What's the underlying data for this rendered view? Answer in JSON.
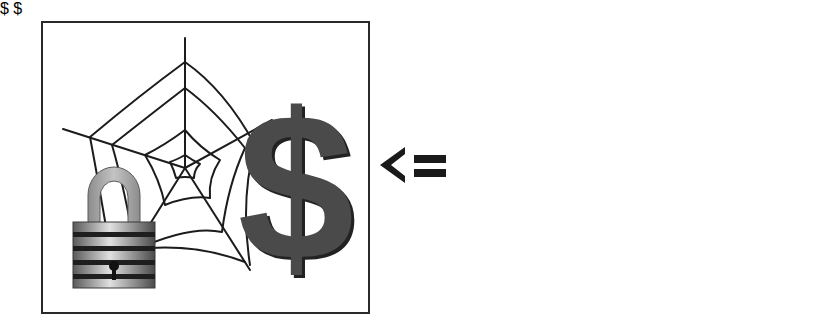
{
  "diagram": {
    "operator_symbol": "<=",
    "left_panel": {
      "description": "Secured web with payment",
      "elements": [
        "spider-web",
        "padlock",
        "dollar-sign"
      ],
      "dollar_glyph": "$"
    },
    "right_panel": {
      "description": "User at computer thinking about web payment",
      "elements": [
        "computer",
        "person",
        "speech-bubble",
        "spider-web",
        "dollar-sign"
      ],
      "dollar_glyph": "$"
    },
    "colors": {
      "stroke": "#1c1c1c",
      "dollar_fill": "#4a4a4a",
      "lock_shackle": "#a8a8a8",
      "lock_body": "#8a8a8a",
      "background": "#ffffff"
    }
  }
}
